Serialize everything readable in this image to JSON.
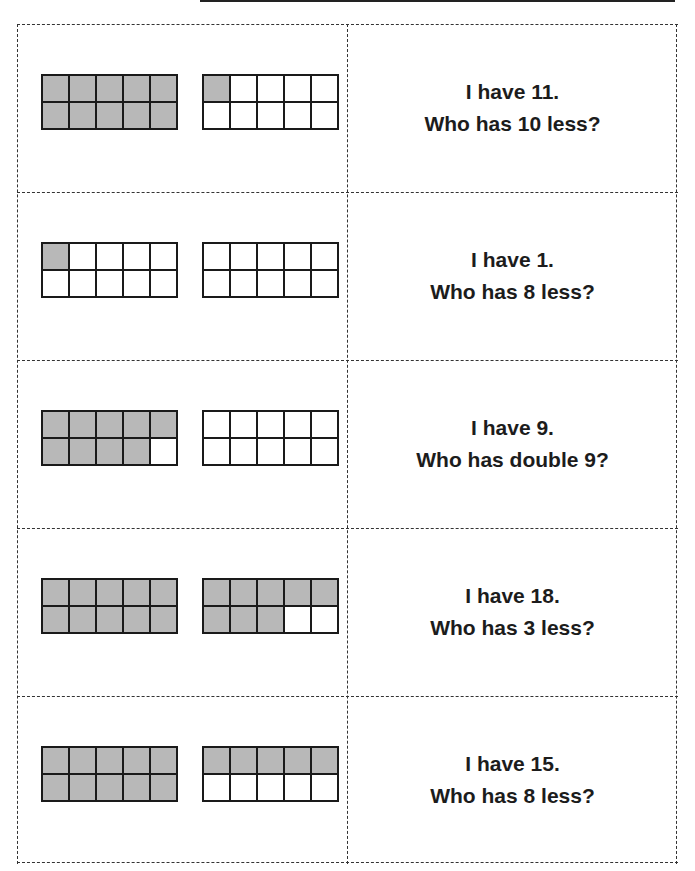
{
  "cards": [
    {
      "left_frame_filled": 10,
      "right_frame_filled": 1,
      "line1": "I have 11.",
      "line2": "Who has 10 less?"
    },
    {
      "left_frame_filled": 1,
      "right_frame_filled": 0,
      "line1": "I have 1.",
      "line2": "Who has 8 less?"
    },
    {
      "left_frame_filled": 9,
      "right_frame_filled": 0,
      "line1": "I have 9.",
      "line2": "Who has double 9?"
    },
    {
      "left_frame_filled": 10,
      "right_frame_filled": 8,
      "line1": "I have 18.",
      "line2": "Who has 3 less?"
    },
    {
      "left_frame_filled": 10,
      "right_frame_filled": 5,
      "line1": "I have 15.",
      "line2": "Who has 8 less?"
    }
  ],
  "colors": {
    "filled": "#b8b8b8",
    "empty": "#ffffff",
    "border": "#1a1a1a"
  }
}
